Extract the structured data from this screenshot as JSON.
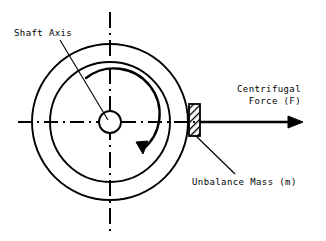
{
  "figure": {
    "type": "engineering-diagram",
    "background_color": "#ffffff",
    "line_color": "#000000"
  },
  "labels": {
    "shaft_axis": "Shaft Axis",
    "centrifugal_force_line1": "Centrifugal",
    "centrifugal_force_line2": "Force (F)",
    "unbalance_mass": "Unbalance Mass (m)"
  },
  "geometry": {
    "center": {
      "x": 110,
      "y": 122
    },
    "outer_circle_radius": 78,
    "inner_circle_radius": 60,
    "hub_circle_radius": 11,
    "rotation_direction": "clockwise"
  },
  "parts": {
    "outer_circle_name": "rotor-outer-circle",
    "inner_circle_name": "rotor-inner-circle",
    "hub_name": "shaft-hub-circle",
    "mass_name": "unbalance-mass-block",
    "force_arrow_name": "centrifugal-force-arrow",
    "rotation_arrow_name": "rotation-direction-arrow",
    "horizontal_axis_name": "horizontal-centerline",
    "vertical_axis_name": "vertical-centerline"
  }
}
